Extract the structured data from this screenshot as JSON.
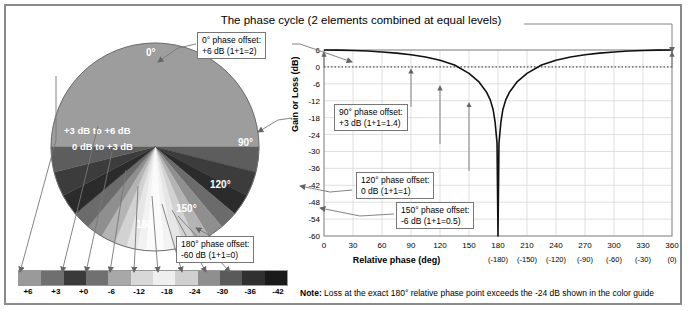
{
  "title": "The phase cycle (2 elements combined at equal levels)",
  "note": {
    "label": "Note:",
    "text": "Loss at the exact 180° relative phase point exceeds the -24 dB shown in the color guide"
  },
  "pie": {
    "labels": [
      {
        "text": "0°",
        "x": 104,
        "y": 14
      },
      {
        "text": "90°",
        "x": 196,
        "y": 104
      },
      {
        "text": "120°",
        "x": 168,
        "y": 146
      },
      {
        "text": "150°",
        "x": 134,
        "y": 170
      },
      {
        "text": "180°",
        "x": 94,
        "y": 186
      }
    ],
    "ranges": [
      {
        "text": "+3 dB to +6 dB",
        "x": 22,
        "y": 92
      },
      {
        "text": "0 dB to +3 dB",
        "x": 30,
        "y": 108
      }
    ]
  },
  "callouts": [
    {
      "id": "c0",
      "title": "0° phase offset:",
      "value": "+6 dB (1+1=2)",
      "x": 197,
      "y": 32
    },
    {
      "id": "c90",
      "title": "90° phase offset:",
      "value": "+3 dB (1+1=1.4)",
      "x": 334,
      "y": 104
    },
    {
      "id": "c120",
      "title": "120° phase offset:",
      "value": "0 dB (1+1=1)",
      "x": 356,
      "y": 172
    },
    {
      "id": "c150",
      "title": "150° phase offset:",
      "value": "-6 dB (1+1=0.5)",
      "x": 396,
      "y": 202
    },
    {
      "id": "c180",
      "title": "180° phase offset:",
      "value": "-60 dB (1+1=0)",
      "x": 176,
      "y": 236
    }
  ],
  "color_guide": {
    "labels": [
      "+6",
      "+3",
      "+0",
      "-6",
      "-12",
      "-18",
      "-24",
      "-30",
      "-36",
      "-42"
    ],
    "swatches": [
      "#9a9a9a",
      "#6f6f6f",
      "#3a3a3a",
      "#707070",
      "#a8a8a8",
      "#d8d8d8",
      "#efefef",
      "#d0d0d0",
      "#8f8f8f",
      "#5a5a5a",
      "#303030",
      "#1a1a1a"
    ]
  },
  "chart_data": {
    "type": "line",
    "title": "The phase cycle (2 elements combined at equal levels)",
    "xlabel": "Relative phase (deg)",
    "ylabel": "Gain or Loss (dB)",
    "xlim": [
      0,
      360
    ],
    "ylim": [
      -60,
      6
    ],
    "grid": true,
    "legend": "none",
    "xticks": [
      0,
      30,
      60,
      90,
      120,
      150,
      180,
      210,
      240,
      270,
      300,
      330,
      360
    ],
    "xticks_alt": [
      "",
      "",
      "",
      "",
      "",
      "",
      "(-180)",
      "(-150)",
      "(-120)",
      "(-90)",
      "(-60)",
      "(-30)",
      "(0)"
    ],
    "yticks": [
      6,
      0,
      -6,
      -12,
      -18,
      -24,
      -30,
      -36,
      -42,
      -48,
      -54,
      -60
    ],
    "reference_line": {
      "y": 0,
      "style": "dotted"
    },
    "x": [
      0,
      15,
      30,
      45,
      60,
      75,
      90,
      105,
      120,
      135,
      150,
      160,
      168,
      172,
      175,
      177,
      179,
      180,
      181,
      183,
      185,
      188,
      192,
      200,
      210,
      225,
      240,
      255,
      270,
      285,
      300,
      315,
      330,
      345,
      360
    ],
    "y": [
      6.0,
      5.96,
      5.83,
      5.62,
      5.31,
      4.88,
      4.31,
      3.52,
      2.39,
      0.66,
      -2.31,
      -5.19,
      -8.87,
      -11.7,
      -15.2,
      -19.6,
      -27.1,
      -60,
      -27.1,
      -19.6,
      -15.2,
      -11.7,
      -8.87,
      -5.19,
      -2.31,
      0.66,
      2.39,
      3.52,
      4.31,
      4.88,
      5.31,
      5.62,
      5.83,
      5.96,
      6.0
    ],
    "annotations": [
      {
        "x": 0,
        "y": 6,
        "label": "0° phase offset: +6 dB (1+1=2)"
      },
      {
        "x": 90,
        "y": 0,
        "label": "90° phase offset: +3 dB (1+1=1.4)"
      },
      {
        "x": 120,
        "y": -6,
        "label": "120° phase offset: 0 dB (1+1=1)"
      },
      {
        "x": 150,
        "y": -12,
        "label": "150° phase offset: -6 dB (1+1=0.5)"
      },
      {
        "x": 180,
        "y": -60,
        "label": "180° phase offset: -60 dB (1+1=0)"
      },
      {
        "x": 360,
        "y": 6,
        "label": "360° phase offset: +6 dB"
      }
    ]
  }
}
